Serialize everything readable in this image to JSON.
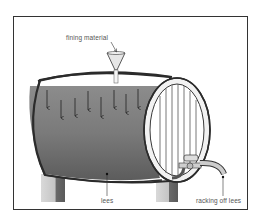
{
  "diagram": {
    "labels": {
      "fining": "fining material",
      "lees": "lees",
      "racking": "racking off lees"
    },
    "colors": {
      "wine": "#6e6e6e",
      "wine_light": "#8a8a8a",
      "outline": "#2b2b2b",
      "stand": "#cfcfcf",
      "stand_shadow": "#7a7a7a"
    },
    "arrow_count": 10
  }
}
